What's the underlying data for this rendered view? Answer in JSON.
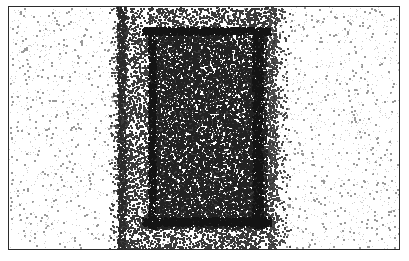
{
  "figure": {
    "title": "",
    "width": 409,
    "height": 261,
    "background_color": "#ffffff"
  },
  "frame": {
    "name": "plot-border",
    "color": "#2b2b2b",
    "line_width": 1,
    "x": 8,
    "y": 6,
    "width": 392,
    "height": 244
  },
  "chart_data": {
    "type": "scatter",
    "title": "",
    "subtitle": "",
    "xlabel": "",
    "ylabel": "",
    "xlim": [
      8,
      400
    ],
    "ylim": [
      6,
      250
    ],
    "grid": false,
    "legend": null,
    "tick_labels_x": [],
    "tick_labels_y": [],
    "annotations": [],
    "render_style": "stipple-dither",
    "point_size_px": 1.4,
    "point_color_dark": "#1a1a1a",
    "point_color_mid": "#555555",
    "point_color_light": "#a8a8a8",
    "seed": 20240517,
    "regions": [
      {
        "name": "background-sparse",
        "role": "outer low-density field",
        "x": 9,
        "y": 7,
        "width": 390,
        "height": 242,
        "points": 1150,
        "color": "#9a9a9a",
        "size": 1.5,
        "density_label": "sparse"
      },
      {
        "name": "band-medium-left-falloff",
        "role": "left soft shoulder of the central band",
        "x": 108,
        "y": 7,
        "width": 18,
        "height": 242,
        "points": 900,
        "color": "#4a4a4a",
        "size": 1.3,
        "density_label": "medium"
      },
      {
        "name": "band-medium",
        "role": "central high-density vertical band",
        "x": 118,
        "y": 7,
        "width": 158,
        "height": 242,
        "points": 9000,
        "color": "#3a3a3a",
        "size": 1.3,
        "density_label": "high"
      },
      {
        "name": "band-medium-right-falloff",
        "role": "right soft shoulder of the central band",
        "x": 268,
        "y": 7,
        "width": 22,
        "height": 242,
        "points": 950,
        "color": "#4a4a4a",
        "size": 1.3,
        "density_label": "medium"
      },
      {
        "name": "inner-rectangle",
        "role": "darker inner rectangle inside the band",
        "x": 150,
        "y": 28,
        "width": 116,
        "height": 200,
        "points": 8200,
        "color": "#222222",
        "size": 1.35,
        "density_label": "very-high"
      },
      {
        "name": "inner-edge-top",
        "role": "reinforced top edge of inner rectangle",
        "x": 142,
        "y": 27,
        "width": 128,
        "height": 7,
        "points": 900,
        "color": "#141414",
        "size": 1.4,
        "density_label": "edge"
      },
      {
        "name": "inner-edge-bottom",
        "role": "reinforced bottom edge of inner rectangle",
        "x": 142,
        "y": 217,
        "width": 128,
        "height": 8,
        "points": 950,
        "color": "#141414",
        "size": 1.4,
        "density_label": "edge"
      },
      {
        "name": "inner-edge-left",
        "role": "reinforced left edge of inner rectangle",
        "x": 148,
        "y": 28,
        "width": 7,
        "height": 200,
        "points": 900,
        "color": "#141414",
        "size": 1.4,
        "density_label": "edge"
      },
      {
        "name": "inner-edge-right",
        "role": "reinforced right edge of inner rectangle",
        "x": 252,
        "y": 28,
        "width": 10,
        "height": 200,
        "points": 1000,
        "color": "#141414",
        "size": 1.4,
        "density_label": "edge"
      },
      {
        "name": "band-left-edge-accent",
        "role": "darker left boundary of the central band",
        "x": 117,
        "y": 7,
        "width": 8,
        "height": 242,
        "points": 700,
        "color": "#2a2a2a",
        "size": 1.35,
        "density_label": "edge"
      },
      {
        "name": "speckle-overlay",
        "role": "scan-noise speckle across whole frame",
        "x": 9,
        "y": 7,
        "width": 390,
        "height": 242,
        "points": 2600,
        "color": "#cfcfcf",
        "size": 1.1,
        "density_label": "noise"
      }
    ]
  },
  "accessibility": {
    "alt_text": "Stippled point-density plot with a dense central vertical band and a darker inner rectangle"
  }
}
